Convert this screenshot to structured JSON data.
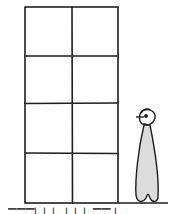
{
  "diagram": {
    "type": "illustration",
    "colors": {
      "stroke": "#1e1e1e",
      "figure_fill": "#dcdcdc",
      "background": "#ffffff"
    },
    "grid": {
      "columns": 2,
      "rows": 4,
      "x": [
        25,
        72,
        118
      ],
      "y": [
        7,
        56,
        103,
        153,
        203
      ]
    },
    "figure": {
      "label": "standing person",
      "x_range": [
        134,
        160
      ],
      "y_range": [
        108,
        203
      ]
    },
    "ground_line": {
      "x1": 118,
      "x2": 168,
      "y": 203
    }
  },
  "caption": {
    "text": "▔▔▔▏▏▏   ▏▏▏▔▔ ▏"
  }
}
